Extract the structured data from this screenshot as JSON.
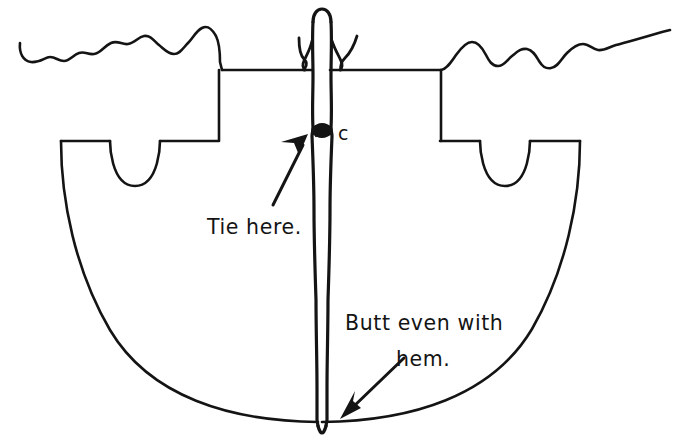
{
  "figure": {
    "kind": "hand-drawn-sewing-diagram",
    "background_color": "#ffffff",
    "ink_color": "#141414",
    "width": 678,
    "height": 436
  },
  "annotations": {
    "tie_here": "Tie here.",
    "butt_even_line1": "Butt even with",
    "butt_even_line2": "hem.",
    "point_label_c": "c"
  },
  "parts": {
    "fabric_outline_name": "garment outline",
    "cord_name": "vertical cord",
    "knot_name": "tie knot",
    "hem_arc_name": "hem arc",
    "left_armhole_name": "left armhole notch",
    "right_armhole_name": "right armhole notch",
    "top_edge_left_name": "left wavy raw edge",
    "top_edge_right_name": "right wavy raw edge"
  }
}
